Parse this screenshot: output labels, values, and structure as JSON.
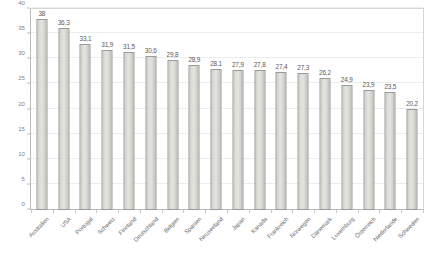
{
  "chart_data": {
    "type": "bar",
    "title": "",
    "subtitle": "",
    "xlabel": "",
    "ylabel": "",
    "ylim": [
      0,
      40
    ],
    "yticks": [
      0,
      5,
      10,
      15,
      20,
      25,
      30,
      35,
      40
    ],
    "ytick_labels": [
      "0",
      "5",
      "10",
      "15",
      "20",
      "25",
      "30",
      "35",
      "40"
    ],
    "grid": true,
    "legend": false,
    "legend_position": "none",
    "decimal_separator": ",",
    "bar_color": "#dcdcd8",
    "bar_border_color": "#9a9a96",
    "categories": [
      "Australien",
      "USA",
      "Portugal",
      "Schweiz",
      "Finnland",
      "Deutschland",
      "Belgien",
      "Spanien",
      "Neuseeland",
      "Japan",
      "Kanada",
      "Frankreich",
      "Norwegen",
      "Dänemark",
      "Luxemburg",
      "Österreich",
      "Niederlande",
      "Schweden"
    ],
    "values": [
      38,
      36.3,
      33.1,
      31.9,
      31.5,
      30.6,
      29.8,
      28.9,
      28.1,
      27.9,
      27.8,
      27.4,
      27.3,
      26.2,
      24.9,
      23.9,
      23.5,
      20.2
    ],
    "value_labels": [
      "38",
      "36,3",
      "33,1",
      "31,9",
      "31,5",
      "30,6",
      "29,8",
      "28,9",
      "28,1",
      "27,9",
      "27,8",
      "27,4",
      "27,3",
      "26,2",
      "24,9",
      "23,9",
      "23,5",
      "20,2"
    ]
  }
}
